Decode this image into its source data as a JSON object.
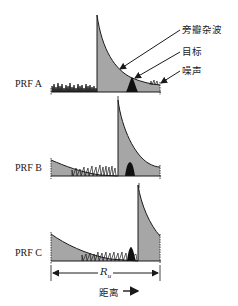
{
  "figure": {
    "title": "",
    "rows": [
      {
        "label": "PRF A",
        "description": "Clutter wall near start of interval, target on clutter tail, noise at left"
      },
      {
        "label": "PRF B",
        "description": "Clutter wall mid-interval, target just after wall"
      },
      {
        "label": "PRF C",
        "description": "Clutter wall near end of interval, target in noise before wall"
      }
    ],
    "annotations": {
      "sidelobe_clutter": "旁瓣杂波",
      "target": "目标",
      "noise": "噪声"
    },
    "interval_label": "R",
    "interval_subscript": "u",
    "axis_label": "距离",
    "axis_arrow": "→",
    "colors": {
      "clutter_fill": "#a6a6a6",
      "target_fill": "#111111",
      "line": "#1a1a1a",
      "background": "#ffffff"
    }
  }
}
